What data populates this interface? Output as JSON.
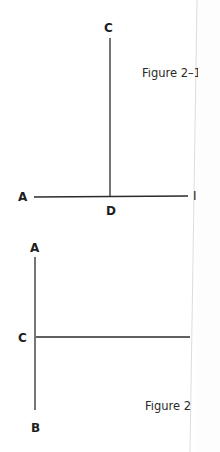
{
  "figures": [
    {
      "caption": "Figure 2–1",
      "caption_visible": "Figure 2–",
      "labels": {
        "top": "C",
        "left": "A",
        "foot": "D",
        "right_partial": "I"
      }
    },
    {
      "caption": "Figure 2",
      "labels": {
        "top": "A",
        "middle": "C",
        "bottom": "B"
      }
    }
  ],
  "colors": {
    "line": "#2b2b2b",
    "label": "#1d1d1d",
    "page_edge": "#d8d8d8"
  }
}
